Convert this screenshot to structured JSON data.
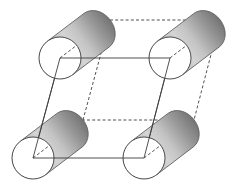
{
  "figure": {
    "type": "crystal-unit-cell-diagram",
    "background_color": "#ffffff",
    "canvas": {
      "width": 242,
      "height": 187
    }
  },
  "style": {
    "line_color": "#404040",
    "line_width": 0.9,
    "dashed_pattern": "3,2.2",
    "circle_fill": "#ffffff",
    "circle_stroke": "#3a3a3a",
    "cylinder_light": "#d8d8d8",
    "cylinder_mid": "#a9a9a9",
    "cylinder_dark": "#7c7c7c",
    "cylinder_edge": "#5a5a5a"
  },
  "geometry": {
    "depth_offset": {
      "dx": 50,
      "dy": -38
    },
    "circle_radius": 21,
    "front_face_vertices": [
      {
        "name": "front-top-left",
        "x": 60,
        "y": 58
      },
      {
        "name": "front-top-right",
        "x": 170,
        "y": 58
      },
      {
        "name": "front-bottom-right",
        "x": 144,
        "y": 158
      },
      {
        "name": "front-bottom-left",
        "x": 33,
        "y": 158
      }
    ],
    "back_face_vertices": [
      {
        "name": "back-top-left",
        "x": 110,
        "y": 20
      },
      {
        "name": "back-top-right",
        "x": 220,
        "y": 20
      },
      {
        "name": "back-bottom-right",
        "x": 194,
        "y": 120
      },
      {
        "name": "back-bottom-left",
        "x": 83,
        "y": 120
      }
    ]
  },
  "cylinders": [
    {
      "name": "cylinder-top-left",
      "cap_x": 60,
      "cap_y": 58,
      "tip_x": 110,
      "tip_y": 20
    },
    {
      "name": "cylinder-top-right",
      "cap_x": 170,
      "cap_y": 58,
      "tip_x": 220,
      "tip_y": 20
    },
    {
      "name": "cylinder-bottom-left",
      "cap_x": 33,
      "cap_y": 158,
      "tip_x": 83,
      "tip_y": 120
    },
    {
      "name": "cylinder-bottom-right",
      "cap_x": 144,
      "cap_y": 158,
      "tip_x": 194,
      "tip_y": 120
    }
  ],
  "labels": {
    "figure_caption": ""
  }
}
